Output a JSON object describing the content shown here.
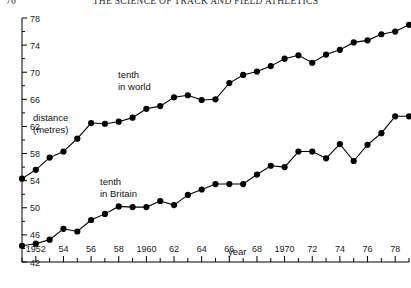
{
  "page": {
    "folio": "76",
    "running_head": "THE SCIENCE OF TRACK AND FIELD ATHLETICS"
  },
  "annotations": {
    "series_world": "tenth\nin world",
    "series_world_line1": "tenth",
    "series_world_line2": "in world",
    "series_britain_line1": "tenth",
    "series_britain_line2": "in Britain",
    "ylabel_line1": "distance",
    "ylabel_line2": "(metres)",
    "xlabel": "year"
  },
  "chart_data": {
    "type": "line",
    "title": "",
    "subtitle": "",
    "xlabel": "year",
    "ylabel": "distance (metres)",
    "xlim": [
      1951,
      1979
    ],
    "ylim": [
      42,
      78
    ],
    "grid": false,
    "legend": "inline-annotations",
    "y_major_ticks": [
      42,
      46,
      50,
      54,
      58,
      62,
      66,
      70,
      74,
      78
    ],
    "y_minor_ticks": [
      44,
      48,
      52,
      56,
      60,
      64,
      68,
      72,
      76
    ],
    "y_tick_labels": [
      "42",
      "46",
      "50",
      "54",
      "58",
      "62",
      "66",
      "70",
      "74",
      "78"
    ],
    "x_major_ticks": [
      1952,
      1954,
      1956,
      1958,
      1960,
      1962,
      1964,
      1966,
      1968,
      1970,
      1972,
      1974,
      1976,
      1978
    ],
    "x_tick_labels": [
      "1952",
      "54",
      "56",
      "58",
      "1960",
      "62",
      "64",
      "66",
      "68",
      "1970",
      "72",
      "74",
      "76",
      "78"
    ],
    "x_minor_ticks": [
      1951,
      1953,
      1955,
      1957,
      1959,
      1961,
      1963,
      1965,
      1967,
      1969,
      1971,
      1973,
      1975,
      1977,
      1979
    ],
    "x": [
      1951,
      1952,
      1953,
      1954,
      1955,
      1956,
      1957,
      1958,
      1959,
      1960,
      1961,
      1962,
      1963,
      1964,
      1965,
      1966,
      1967,
      1968,
      1969,
      1970,
      1971,
      1972,
      1973,
      1974,
      1975,
      1976,
      1977,
      1978,
      1979
    ],
    "series": [
      {
        "name": "tenth in world",
        "marker": "filled-circle",
        "values": [
          54.3,
          55.6,
          57.4,
          58.3,
          60.2,
          62.5,
          62.4,
          62.7,
          63.3,
          64.6,
          65.0,
          66.3,
          66.6,
          65.9,
          66.0,
          68.4,
          69.6,
          70.1,
          70.9,
          72.0,
          72.5,
          71.4,
          72.6,
          73.3,
          74.4,
          74.7,
          75.6,
          76.0,
          77.0
        ]
      },
      {
        "name": "tenth in Britain",
        "marker": "filled-circle",
        "values": [
          44.4,
          44.7,
          45.3,
          46.9,
          46.5,
          48.2,
          49.1,
          50.2,
          50.1,
          50.1,
          51.0,
          50.4,
          51.9,
          52.7,
          53.5,
          53.5,
          53.5,
          54.9,
          56.2,
          56.0,
          58.3,
          58.3,
          57.3,
          59.4,
          56.9,
          59.3,
          61.0,
          63.5,
          63.5
        ]
      }
    ]
  }
}
